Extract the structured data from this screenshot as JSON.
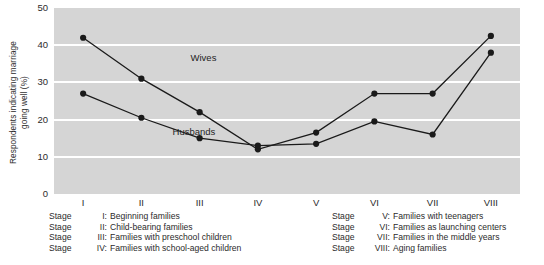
{
  "chart_data": {
    "type": "line",
    "title": "",
    "xlabel": "",
    "ylabel": "Respondents indicating marriage going well (%)",
    "ylabel_line1": "Respondents indicating marriage",
    "ylabel_line2": "going well (%)",
    "categories": [
      "I",
      "II",
      "III",
      "IV",
      "V",
      "VI",
      "VII",
      "VIII"
    ],
    "ylim": [
      0,
      50
    ],
    "yticks": [
      0,
      10,
      20,
      30,
      40,
      50
    ],
    "gridlines": [
      10,
      20,
      30,
      40
    ],
    "grid": true,
    "legend_position": "inline-annotations",
    "series": [
      {
        "name": "Wives",
        "values": [
          42,
          31,
          22,
          12,
          16.5,
          27,
          27,
          42.5
        ],
        "color": "#1a1a1a"
      },
      {
        "name": "Husbands",
        "values": [
          27,
          20.5,
          15,
          13,
          13.5,
          19.5,
          16,
          38
        ],
        "color": "#1a1a1a"
      }
    ],
    "annotations": [
      {
        "text": "Wives",
        "x": 2.05,
        "y": 36.5
      },
      {
        "text": "Husbands",
        "x": 2.05,
        "y": 16.8
      }
    ],
    "plot_background": "#d5d5d5",
    "gridline_color": "#ffffff",
    "marker": "filled-circle"
  },
  "stage_legend": {
    "left": [
      {
        "stage": "Stage",
        "numeral": "I:",
        "text": "Beginning families"
      },
      {
        "stage": "Stage",
        "numeral": "II:",
        "text": "Child-bearing families"
      },
      {
        "stage": "Stage",
        "numeral": "III:",
        "text": "Families with preschool children"
      },
      {
        "stage": "Stage",
        "numeral": "IV:",
        "text": "Families with school-aged children"
      }
    ],
    "right": [
      {
        "stage": "Stage",
        "numeral": "V:",
        "text": "Families with teenagers"
      },
      {
        "stage": "Stage",
        "numeral": "VI:",
        "text": "Families as launching centers"
      },
      {
        "stage": "Stage",
        "numeral": "VII:",
        "text": "Families in the middle years"
      },
      {
        "stage": "Stage",
        "numeral": "VIII:",
        "text": "Aging families"
      }
    ]
  }
}
